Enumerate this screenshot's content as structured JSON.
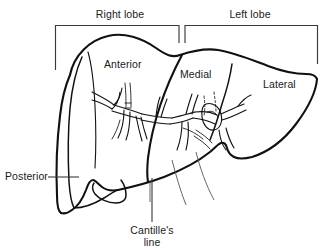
{
  "figure": {
    "view": "anterior-superior oblique",
    "line_color": "#111111",
    "label_color": "#1a1a1a",
    "background_color": "#ffffff"
  },
  "brackets": [
    {
      "id": "right-lobe",
      "label": "Right lobe"
    },
    {
      "id": "left-lobe",
      "label": "Left lobe"
    }
  ],
  "segment_labels": [
    {
      "id": "anterior",
      "label": "Anterior"
    },
    {
      "id": "medial",
      "label": "Medial"
    },
    {
      "id": "lateral",
      "label": "Lateral"
    }
  ],
  "callouts": [
    {
      "id": "posterior",
      "label": "Posterior"
    },
    {
      "id": "cantilles-line",
      "label_line_1": "Cantille's",
      "label_line_2": "line"
    }
  ]
}
